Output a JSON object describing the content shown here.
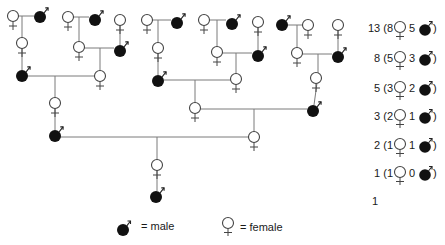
{
  "diagram": {
    "type": "pedigree",
    "colors": {
      "line": "#7a7a7a",
      "outline": "#444444",
      "male_fill": "#111111",
      "female_fill": "#ffffff"
    },
    "nodes": [
      {
        "id": "n1",
        "sex": "female",
        "x": 13,
        "y": 16
      },
      {
        "id": "n2",
        "sex": "male",
        "x": 40,
        "y": 17
      },
      {
        "id": "n3",
        "sex": "female",
        "x": 68,
        "y": 17
      },
      {
        "id": "n4",
        "sex": "male",
        "x": 95,
        "y": 20
      },
      {
        "id": "n5",
        "sex": "female",
        "x": 120,
        "y": 20
      },
      {
        "id": "n6",
        "sex": "female",
        "x": 147,
        "y": 20
      },
      {
        "id": "n7",
        "sex": "male",
        "x": 177,
        "y": 23
      },
      {
        "id": "n8",
        "sex": "female",
        "x": 204,
        "y": 20
      },
      {
        "id": "n9",
        "sex": "male",
        "x": 232,
        "y": 24
      },
      {
        "id": "n10",
        "sex": "female",
        "x": 258,
        "y": 22
      },
      {
        "id": "n11",
        "sex": "male",
        "x": 282,
        "y": 25
      },
      {
        "id": "n12",
        "sex": "female",
        "x": 308,
        "y": 25
      },
      {
        "id": "n13",
        "sex": "female",
        "x": 338,
        "y": 25
      },
      {
        "id": "n14",
        "sex": "female",
        "x": 22,
        "y": 43
      },
      {
        "id": "n15",
        "sex": "female",
        "x": 79,
        "y": 47
      },
      {
        "id": "n16",
        "sex": "male",
        "x": 120,
        "y": 51
      },
      {
        "id": "n17",
        "sex": "female",
        "x": 158,
        "y": 48
      },
      {
        "id": "n18",
        "sex": "female",
        "x": 217,
        "y": 52
      },
      {
        "id": "n19",
        "sex": "male",
        "x": 258,
        "y": 56
      },
      {
        "id": "n20",
        "sex": "female",
        "x": 297,
        "y": 53
      },
      {
        "id": "n21",
        "sex": "male",
        "x": 338,
        "y": 57
      },
      {
        "id": "n22",
        "sex": "male",
        "x": 22,
        "y": 76
      },
      {
        "id": "n23",
        "sex": "female",
        "x": 100,
        "y": 76
      },
      {
        "id": "n24",
        "sex": "male",
        "x": 158,
        "y": 81
      },
      {
        "id": "n25",
        "sex": "female",
        "x": 236,
        "y": 79
      },
      {
        "id": "n26",
        "sex": "female",
        "x": 316,
        "y": 78
      },
      {
        "id": "n27",
        "sex": "female",
        "x": 55,
        "y": 103
      },
      {
        "id": "n28",
        "sex": "female",
        "x": 195,
        "y": 108
      },
      {
        "id": "n29",
        "sex": "male",
        "x": 313,
        "y": 111
      },
      {
        "id": "n30",
        "sex": "male",
        "x": 55,
        "y": 136
      },
      {
        "id": "n31",
        "sex": "female",
        "x": 254,
        "y": 137
      },
      {
        "id": "n32",
        "sex": "female",
        "x": 157,
        "y": 165
      },
      {
        "id": "n33",
        "sex": "male",
        "x": 156,
        "y": 197
      }
    ],
    "lines": [
      [
        18,
        16,
        34,
        16
      ],
      [
        73,
        17,
        89,
        17
      ],
      [
        152,
        20,
        171,
        20
      ],
      [
        209,
        20,
        226,
        20
      ],
      [
        287,
        25,
        303,
        25
      ],
      [
        84,
        48,
        114,
        48
      ],
      [
        222,
        53,
        252,
        53
      ],
      [
        302,
        54,
        332,
        54
      ],
      [
        27,
        76,
        95,
        76
      ],
      [
        164,
        80,
        231,
        80
      ],
      [
        200,
        109,
        307,
        109
      ],
      [
        60,
        137,
        249,
        137
      ],
      [
        22,
        16,
        22,
        38
      ],
      [
        79,
        17,
        79,
        42
      ],
      [
        158,
        20,
        158,
        43
      ],
      [
        217,
        20,
        217,
        47
      ],
      [
        297,
        25,
        297,
        48
      ],
      [
        100,
        48,
        100,
        71
      ],
      [
        236,
        53,
        236,
        74
      ],
      [
        318,
        54,
        318,
        73
      ],
      [
        55,
        76,
        55,
        98
      ],
      [
        195,
        80,
        195,
        103
      ],
      [
        254,
        109,
        254,
        132
      ],
      [
        157,
        137,
        157,
        160
      ],
      [
        22,
        48,
        22,
        70
      ],
      [
        120,
        25,
        120,
        45
      ],
      [
        158,
        53,
        158,
        75
      ],
      [
        258,
        27,
        258,
        50
      ],
      [
        338,
        30,
        338,
        51
      ],
      [
        317,
        83,
        314,
        105
      ],
      [
        55,
        108,
        55,
        130
      ],
      [
        157,
        170,
        157,
        191
      ]
    ]
  },
  "counts": {
    "open": "(",
    "close": ")",
    "rows": [
      {
        "total": "13",
        "females": "8",
        "males": "5"
      },
      {
        "total": "8",
        "females": "5",
        "males": "3"
      },
      {
        "total": "5",
        "females": "3",
        "males": "2"
      },
      {
        "total": "3",
        "females": "2",
        "males": "1"
      },
      {
        "total": "2",
        "females": "1",
        "males": "1"
      },
      {
        "total": "1",
        "females": "1",
        "males": "0"
      }
    ],
    "final": "1"
  },
  "legend": {
    "male_label": "= male",
    "female_label": "= female"
  }
}
